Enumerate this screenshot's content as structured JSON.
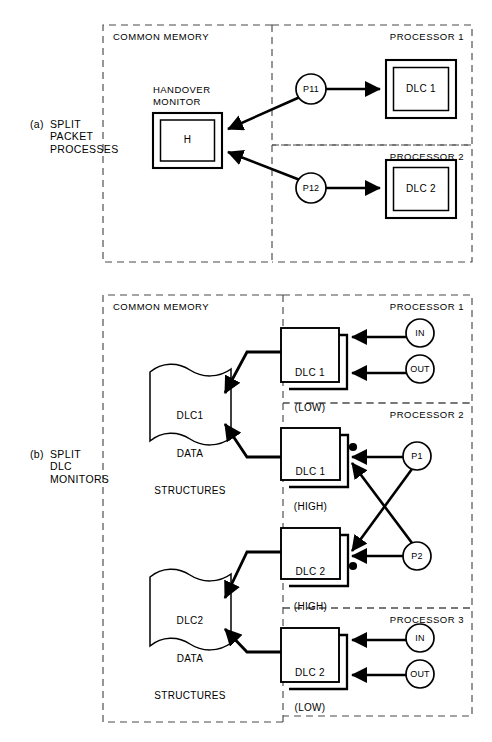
{
  "figure": {
    "panels": [
      {
        "id": "a",
        "caption_tag": "(a)",
        "caption_body": "SPLIT\nPACKET\nPROCESSES",
        "common_memory_label": "COMMON MEMORY",
        "processors": [
          {
            "id": "p1",
            "label": "PROCESSOR 1"
          },
          {
            "id": "p2",
            "label": "PROCESSOR 2"
          }
        ],
        "monitor": {
          "title": "HANDOVER\nMONITOR",
          "box_label": "H"
        },
        "processes": [
          {
            "id": "p11",
            "label": "P11"
          },
          {
            "id": "p12",
            "label": "P12"
          }
        ],
        "dlc_boxes": [
          {
            "id": "dlc1",
            "label": "DLC 1"
          },
          {
            "id": "dlc2",
            "label": "DLC 2"
          }
        ]
      },
      {
        "id": "b",
        "caption_tag": "(b)",
        "caption_body": "SPLIT\nDLC\nMONITORS",
        "common_memory_label": "COMMON MEMORY",
        "processors": [
          {
            "id": "p1",
            "label": "PROCESSOR 1"
          },
          {
            "id": "p2",
            "label": "PROCESSOR 2"
          },
          {
            "id": "p3",
            "label": "PROCESSOR 3"
          }
        ],
        "data_structures": [
          {
            "id": "dlc1ds",
            "line1": "DLC1",
            "line2": "DATA",
            "line3": "STRUCTURES"
          },
          {
            "id": "dlc2ds",
            "line1": "DLC2",
            "line2": "DATA",
            "line3": "STRUCTURES"
          }
        ],
        "dlc_boxes": [
          {
            "id": "dlc1low",
            "line1": "DLC 1",
            "line2": "(LOW)"
          },
          {
            "id": "dlc1high",
            "line1": "DLC 1",
            "line2": "(HIGH)"
          },
          {
            "id": "dlc2high",
            "line1": "DLC 2",
            "line2": "(HIGH)"
          },
          {
            "id": "dlc2low",
            "line1": "DLC 2",
            "line2": "(LOW)"
          }
        ],
        "io_nodes": [
          {
            "id": "in1",
            "label": "IN"
          },
          {
            "id": "out1",
            "label": "OUT"
          },
          {
            "id": "in3",
            "label": "IN"
          },
          {
            "id": "out3",
            "label": "OUT"
          }
        ],
        "process_nodes": [
          {
            "id": "proc-p1",
            "label": "P1"
          },
          {
            "id": "proc-p2",
            "label": "P2"
          }
        ]
      }
    ]
  },
  "colors": {
    "ink": "#000000",
    "paper": "#ffffff",
    "dashed": "#555555"
  }
}
